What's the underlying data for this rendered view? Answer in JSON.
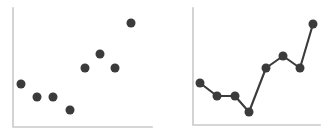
{
  "figure": {
    "background_color": "#ffffff",
    "marker_color": "#3b3b3b",
    "axis_color": "#c9c9c9",
    "panel_count": 2
  },
  "chart_data": [
    {
      "type": "scatter",
      "title": "",
      "subtitle": "",
      "xlabel": "",
      "ylabel": "",
      "xlim": [
        0,
        10
      ],
      "ylim": [
        0,
        10
      ],
      "grid": false,
      "legend": null,
      "xticklabels": [],
      "yticklabels": [],
      "annotations": [],
      "series": [
        {
          "name": "points",
          "marker": "circle",
          "marker_size": 9,
          "color": "#3b3b3b",
          "x": [
            0.6,
            1.7,
            2.9,
            4.1,
            5.2,
            6.3,
            7.4,
            8.5
          ],
          "y": [
            4.2,
            3.2,
            3.2,
            1.8,
            5.5,
            6.7,
            5.5,
            9.2
          ],
          "px": [
            21,
            37,
            53,
            70,
            85,
            100,
            115,
            131
          ],
          "py": [
            84,
            97,
            97,
            110,
            68,
            54,
            68,
            23
          ]
        }
      ],
      "axis": {
        "x_px": [
          13,
          152
        ],
        "y_px": [
          8,
          127
        ],
        "baseline_px": 127,
        "left_px": 13
      }
    },
    {
      "type": "line",
      "title": "",
      "subtitle": "",
      "xlabel": "",
      "ylabel": "",
      "xlim": [
        0,
        10
      ],
      "ylim": [
        0,
        10
      ],
      "grid": false,
      "legend": null,
      "xticklabels": [],
      "yticklabels": [],
      "annotations": [],
      "series": [
        {
          "name": "trend",
          "marker": "circle",
          "marker_size": 9,
          "color": "#3b3b3b",
          "x": [
            0.5,
            1.8,
            3.2,
            4.3,
            5.6,
            6.9,
            8.2,
            9.4
          ],
          "y": [
            4.1,
            3.0,
            3.0,
            1.6,
            5.3,
            6.4,
            5.3,
            9.1
          ],
          "px": [
            200,
            217,
            235,
            249,
            266,
            283,
            300,
            313
          ],
          "py": [
            83,
            96,
            96,
            112,
            68,
            56,
            68,
            24
          ]
        }
      ],
      "axis": {
        "x_px": [
          193,
          320
        ],
        "y_px": [
          8,
          125
        ],
        "baseline_px": 125,
        "left_px": 193
      }
    }
  ]
}
